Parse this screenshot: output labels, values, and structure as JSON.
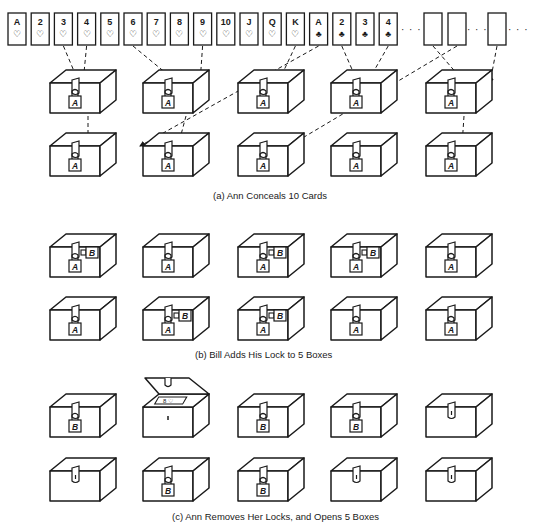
{
  "figure": {
    "cards": {
      "hearts": [
        {
          "rank": "A",
          "suit": "heart"
        },
        {
          "rank": "2",
          "suit": "heart"
        },
        {
          "rank": "3",
          "suit": "heart"
        },
        {
          "rank": "4",
          "suit": "heart"
        },
        {
          "rank": "5",
          "suit": "heart"
        },
        {
          "rank": "6",
          "suit": "heart"
        },
        {
          "rank": "7",
          "suit": "heart"
        },
        {
          "rank": "8",
          "suit": "heart"
        },
        {
          "rank": "9",
          "suit": "heart"
        },
        {
          "rank": "10",
          "suit": "heart"
        },
        {
          "rank": "J",
          "suit": "heart"
        },
        {
          "rank": "Q",
          "suit": "heart"
        },
        {
          "rank": "K",
          "suit": "heart"
        }
      ],
      "clubs": [
        {
          "rank": "A",
          "suit": "club"
        },
        {
          "rank": "2",
          "suit": "club"
        },
        {
          "rank": "3",
          "suit": "club"
        },
        {
          "rank": "4",
          "suit": "club"
        }
      ],
      "blank_cards": 3,
      "ellipsis": "· · ·"
    },
    "lock_labels": {
      "ann": "A",
      "bill": "B"
    },
    "panels": [
      {
        "id": "a",
        "caption": "(a)  Ann Conceals 10 Cards",
        "boxes": [
          [
            "A",
            "A",
            "A",
            "A",
            "A"
          ],
          [
            "A",
            "A",
            "A",
            "A",
            "A"
          ]
        ]
      },
      {
        "id": "b",
        "caption": "(b)  Bill Adds His Lock to 5 Boxes",
        "boxes": [
          [
            "AB",
            "A",
            "AB",
            "AB",
            "A"
          ],
          [
            "A",
            "AB",
            "AB",
            "A",
            "A"
          ]
        ]
      },
      {
        "id": "c",
        "caption": "(c)  Ann Removes Her Locks, and Opens 5 Boxes",
        "boxes": [
          [
            "B",
            "open",
            "B",
            "B",
            "none"
          ],
          [
            "none",
            "B",
            "B",
            "none",
            "none"
          ]
        ]
      }
    ]
  }
}
